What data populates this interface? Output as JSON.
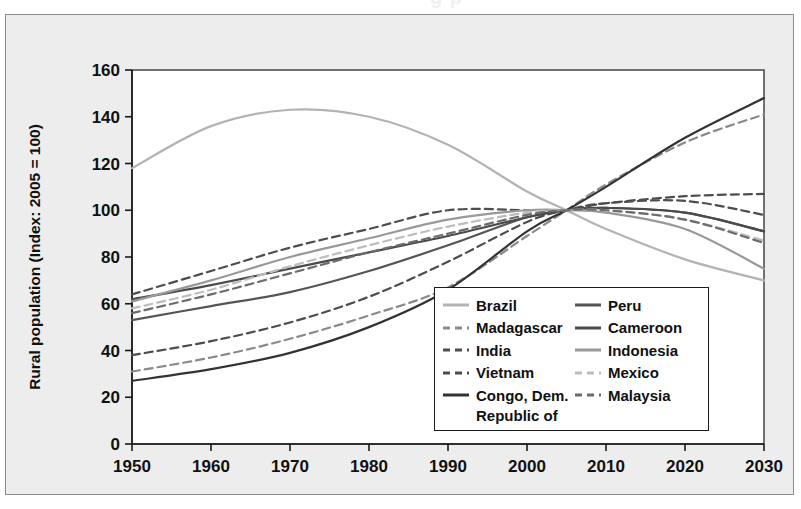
{
  "figure": {
    "background_color": "#ededed",
    "border_color": "#8c8c8c",
    "cut_off_caption_fragment": "g    p"
  },
  "chart_data": {
    "type": "line",
    "title": "",
    "subtitle": "",
    "xlabel": "",
    "ylabel": "Rural population (Index: 2005 = 100)",
    "xlim": [
      1950,
      2030
    ],
    "ylim": [
      0,
      160
    ],
    "xticks": [
      "1950",
      "1960",
      "1970",
      "1980",
      "1990",
      "2000",
      "2010",
      "2020",
      "2030"
    ],
    "yticks": [
      "0",
      "20",
      "40",
      "60",
      "80",
      "100",
      "120",
      "140",
      "160"
    ],
    "grid": false,
    "legend_position": "inside-lower-right",
    "index_base_year": 2005,
    "index_base_value": 100,
    "x": [
      1950,
      1960,
      1970,
      1980,
      1990,
      2000,
      2005,
      2010,
      2020,
      2030
    ],
    "series": [
      {
        "name": "Brazil",
        "color": "#b3b3b3",
        "style": "solid",
        "values": [
          118,
          136,
          143,
          140,
          128,
          108,
          100,
          92,
          79,
          70
        ]
      },
      {
        "name": "Madagascar",
        "color": "#8a8a8a",
        "style": "dashed",
        "values": [
          31,
          37,
          45,
          55,
          67,
          89,
          100,
          111,
          129,
          141
        ]
      },
      {
        "name": "India",
        "color": "#4d4d4d",
        "style": "dashed",
        "values": [
          64,
          74,
          84,
          92,
          100,
          100,
          100,
          103,
          106,
          107
        ]
      },
      {
        "name": "Vietnam",
        "color": "#4d4d4d",
        "style": "dashed",
        "values": [
          38,
          44,
          52,
          63,
          78,
          95,
          100,
          103,
          104,
          98
        ]
      },
      {
        "name": "Congo, Dem. Republic of",
        "color": "#333333",
        "style": "solid",
        "values": [
          27,
          32,
          39,
          50,
          66,
          91,
          100,
          110,
          131,
          148
        ]
      },
      {
        "name": "Peru",
        "color": "#555555",
        "style": "solid",
        "values": [
          53,
          59,
          65,
          74,
          85,
          97,
          100,
          101,
          99,
          91
        ]
      },
      {
        "name": "Cameroon",
        "color": "#4a4a4a",
        "style": "solid",
        "values": [
          62,
          68,
          75,
          82,
          89,
          97,
          100,
          101,
          99,
          91
        ]
      },
      {
        "name": "Indonesia",
        "color": "#999999",
        "style": "solid",
        "values": [
          61,
          70,
          80,
          88,
          96,
          100,
          100,
          99,
          92,
          75
        ]
      },
      {
        "name": "Mexico",
        "color": "#bdbdbd",
        "style": "dashed",
        "values": [
          58,
          66,
          76,
          85,
          93,
          99,
          100,
          100,
          96,
          87
        ]
      },
      {
        "name": "Malaysia",
        "color": "#6b6b6b",
        "style": "dashed",
        "values": [
          56,
          64,
          73,
          82,
          90,
          98,
          100,
          100,
          96,
          86
        ]
      }
    ]
  },
  "legend": {
    "column_left": [
      {
        "label": "Brazil",
        "color": "#b3b3b3",
        "style": "solid"
      },
      {
        "label": "Madagascar",
        "color": "#8a8a8a",
        "style": "dashed"
      },
      {
        "label": "India",
        "color": "#4d4d4d",
        "style": "dashed"
      },
      {
        "label": "Vietnam",
        "color": "#4d4d4d",
        "style": "dashed"
      },
      {
        "label": "Congo, Dem.",
        "color": "#333333",
        "style": "solid"
      }
    ],
    "continuation_line": "Republic of",
    "column_right": [
      {
        "label": "Peru",
        "color": "#555555",
        "style": "solid"
      },
      {
        "label": "Cameroon",
        "color": "#4a4a4a",
        "style": "solid"
      },
      {
        "label": "Indonesia",
        "color": "#999999",
        "style": "solid"
      },
      {
        "label": "Mexico",
        "color": "#bdbdbd",
        "style": "dashed"
      },
      {
        "label": "Malaysia",
        "color": "#6b6b6b",
        "style": "dashed"
      }
    ]
  }
}
